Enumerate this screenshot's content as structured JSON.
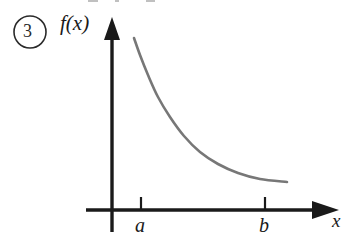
{
  "figure": {
    "problem_number": "3",
    "problem_number_marker": "circled-number",
    "background_color": "#ffffff",
    "axis_color": "#1a1a1a",
    "curve_color": "#777777",
    "label_color": "#1a1a1a"
  },
  "axes": {
    "y_axis_label": "f(x)",
    "x_axis_label": "x",
    "x_axis_y_px": 210,
    "y_axis_x_px": 112,
    "x_axis_arrow": "right-arrowhead",
    "y_axis_arrow": "up-arrowhead"
  },
  "ticks": [
    {
      "label": "a",
      "x_px": 141
    },
    {
      "label": "b",
      "x_px": 265
    }
  ],
  "chart_data": {
    "type": "line",
    "title": "",
    "subtitle": "",
    "xlabel": "x",
    "ylabel": "f(x)",
    "legend": [],
    "legend_position": "none",
    "grid": false,
    "annotations": [
      "3"
    ],
    "tick_labels_x": [
      "a",
      "b"
    ],
    "tick_labels_y": [],
    "series": [
      {
        "name": "f(x)",
        "color": "#777777",
        "x": [
          134,
          140,
          148,
          158,
          170,
          184,
          200,
          218,
          238,
          260,
          287
        ],
        "y": [
          38,
          55,
          75,
          97,
          117,
          136,
          152,
          164,
          173,
          179,
          182
        ]
      }
    ],
    "xlim": [
      112,
      338
    ],
    "ylim": [
      210,
      18
    ]
  }
}
